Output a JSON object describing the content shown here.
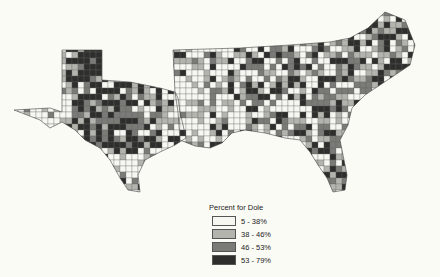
{
  "map": {
    "subject": "County-level vote share for Dole, Southern US states",
    "palette": [
      "#f7f7f2",
      "#b4b4ae",
      "#7a7a76",
      "#2e2e2c"
    ],
    "stroke": "#555555"
  },
  "legend": {
    "title": "Percent for Dole",
    "items": [
      {
        "label": "5 - 38%",
        "color": "#f7f7f2"
      },
      {
        "label": "38 - 46%",
        "color": "#b4b4ae"
      },
      {
        "label": "46 - 53%",
        "color": "#7a7a76"
      },
      {
        "label": "53 - 79%",
        "color": "#2e2e2c"
      }
    ]
  }
}
